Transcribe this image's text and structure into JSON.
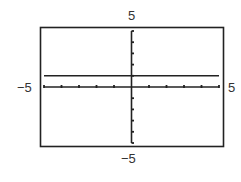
{
  "chart_data": {
    "type": "line",
    "title": "",
    "xlabel": "",
    "ylabel": "",
    "xlim": [
      -5,
      5
    ],
    "ylim": [
      -5,
      5
    ],
    "x_ticks_step": 1,
    "y_ticks_step": 1,
    "grid": false,
    "series": [
      {
        "name": "y = 1",
        "x": [
          -5,
          5
        ],
        "y": [
          1,
          1
        ]
      }
    ],
    "window_labels": {
      "xmin": "−5",
      "xmax": "5",
      "ymin": "−5",
      "ymax": "5"
    }
  },
  "colors": {
    "frame": "#222222",
    "axis": "#222222",
    "line": "#222222",
    "text": "#333333"
  }
}
